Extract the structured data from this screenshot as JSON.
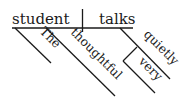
{
  "diagram": {
    "type": "Reed-Kellogg sentence diagram",
    "subject": "student",
    "predicate": "talks",
    "subject_modifiers": [
      "The",
      "thoughtful"
    ],
    "predicate_modifiers": [
      "quietly"
    ],
    "modifier_of_modifier": {
      "target": "quietly",
      "word": "very"
    },
    "line_color": "#1a1a1a",
    "background": "#ffffff"
  }
}
